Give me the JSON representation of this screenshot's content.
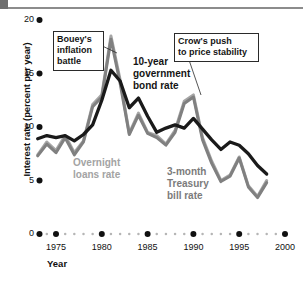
{
  "figure": {
    "background": "#ffffff"
  },
  "chart_data": {
    "type": "line",
    "title": "",
    "xlabel": "Year",
    "ylabel": "Interest rate (percent per year)",
    "xlim": [
      1973,
      2000
    ],
    "ylim": [
      0,
      20
    ],
    "xticks": [
      1975,
      1980,
      1985,
      1990,
      1995,
      2000
    ],
    "xtick_labels": [
      "1975",
      "1980",
      "1985",
      "1990",
      "1995",
      "2000"
    ],
    "yticks": [
      0,
      5,
      10,
      15,
      20
    ],
    "ytick_labels": [
      "0",
      "5",
      "10",
      "15",
      "20"
    ],
    "grid": false,
    "legend_position": "inline-annotations",
    "x": [
      1973,
      1974,
      1975,
      1976,
      1977,
      1978,
      1979,
      1980,
      1981,
      1982,
      1983,
      1984,
      1985,
      1986,
      1987,
      1988,
      1989,
      1990,
      1991,
      1992,
      1993,
      1994,
      1995,
      1996,
      1997,
      1998
    ],
    "series": [
      {
        "name": "10-year government bond rate",
        "color": "#1a1a1a",
        "values": [
          8.9,
          9.2,
          9.0,
          9.2,
          8.7,
          9.3,
          10.2,
          12.5,
          15.3,
          14.3,
          11.8,
          12.7,
          11.0,
          9.5,
          9.9,
          10.2,
          9.9,
          10.8,
          9.8,
          8.8,
          7.9,
          8.6,
          8.3,
          7.5,
          6.4,
          5.6
        ]
      },
      {
        "name": "Overnight loans rate",
        "color": "#a6a6a6",
        "values": [
          7.4,
          8.6,
          7.8,
          9.2,
          7.6,
          8.7,
          12.1,
          13.0,
          18.5,
          14.4,
          9.4,
          11.3,
          9.5,
          9.2,
          8.4,
          9.7,
          12.4,
          13.0,
          9.0,
          6.8,
          5.0,
          5.5,
          7.2,
          4.5,
          3.5,
          5.0
        ]
      },
      {
        "name": "3-month Treasury bill rate",
        "color": "#808080",
        "values": [
          7.3,
          8.4,
          7.6,
          9.0,
          7.4,
          8.6,
          11.9,
          12.8,
          18.2,
          14.1,
          9.3,
          11.1,
          9.4,
          9.0,
          8.3,
          9.5,
          12.2,
          12.8,
          8.8,
          6.6,
          4.9,
          5.4,
          7.1,
          4.4,
          3.4,
          4.8
        ]
      }
    ],
    "annotations": [
      {
        "id": "bouey",
        "text": "Bouey's\ninflation\nbattle",
        "target_x": 1981,
        "target_y": 17.0
      },
      {
        "id": "crow",
        "text": "Crow's push\nto price stability",
        "target_x": 1990,
        "target_y": 12.6
      }
    ],
    "series_labels": [
      {
        "id": "bond",
        "text": "10-year\ngovernment\nbond rate",
        "color": "#141414"
      },
      {
        "id": "overnight",
        "text": "Overnight\nloans rate",
        "color": "#a3a3a3"
      },
      {
        "id": "treasury",
        "text": "3-month\nTreasury\nbill rate",
        "color": "#7b7b7b"
      }
    ]
  }
}
